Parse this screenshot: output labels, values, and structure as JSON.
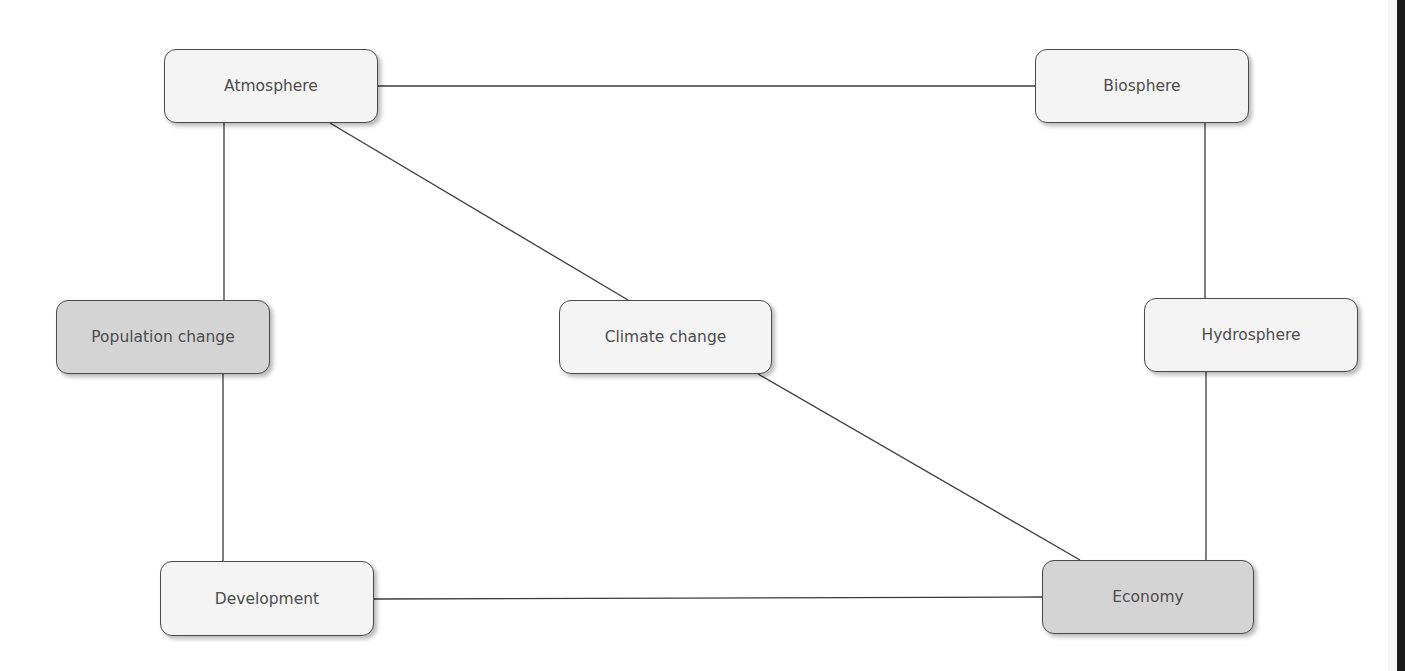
{
  "diagram": {
    "nodes": [
      {
        "id": "atmosphere",
        "label": "Atmosphere",
        "shaded": false
      },
      {
        "id": "biosphere",
        "label": "Biosphere",
        "shaded": false
      },
      {
        "id": "population",
        "label": "Population change",
        "shaded": true
      },
      {
        "id": "climate",
        "label": "Climate change",
        "shaded": false
      },
      {
        "id": "hydrosphere",
        "label": "Hydrosphere",
        "shaded": false
      },
      {
        "id": "development",
        "label": "Development",
        "shaded": false
      },
      {
        "id": "economy",
        "label": "Economy",
        "shaded": true
      }
    ],
    "edges": [
      {
        "from": "atmosphere",
        "to": "biosphere"
      },
      {
        "from": "atmosphere",
        "to": "population"
      },
      {
        "from": "atmosphere",
        "to": "climate"
      },
      {
        "from": "biosphere",
        "to": "hydrosphere"
      },
      {
        "from": "population",
        "to": "development"
      },
      {
        "from": "climate",
        "to": "economy"
      },
      {
        "from": "hydrosphere",
        "to": "economy"
      },
      {
        "from": "development",
        "to": "economy"
      }
    ]
  }
}
